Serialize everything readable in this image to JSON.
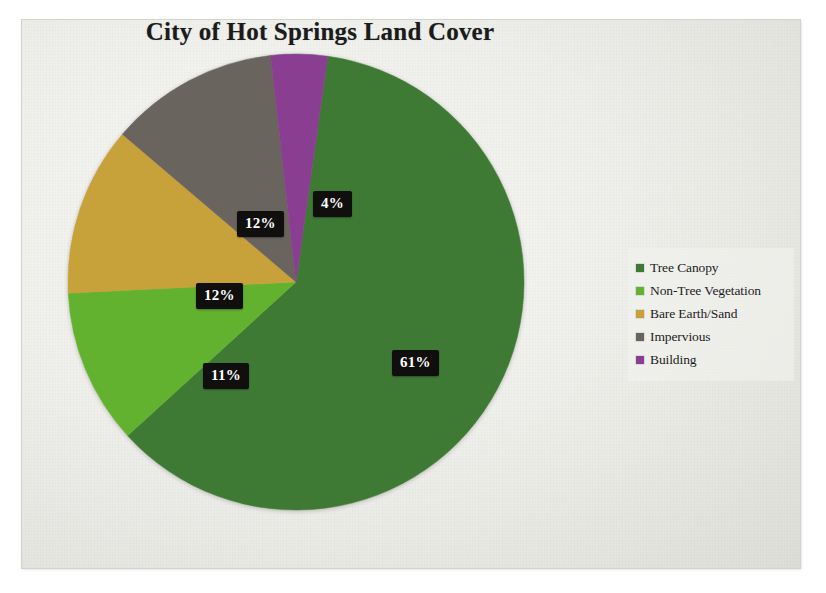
{
  "chart_data": {
    "type": "pie",
    "title": "City of Hot Springs Land Cover",
    "xlabel": "",
    "ylabel": "",
    "legend_position": "right",
    "grid": false,
    "categories": [
      "Tree Canopy",
      "Non-Tree Vegetation",
      "Bare Earth/Sand",
      "Impervious",
      "Building"
    ],
    "values": [
      61,
      11,
      12,
      12,
      4
    ],
    "value_unit": "%",
    "data_labels": [
      "61%",
      "11%",
      "12%",
      "12%",
      "4%"
    ],
    "colors": [
      "#3f7a35",
      "#63b22f",
      "#c7a23a",
      "#6a645f",
      "#8a3e91"
    ],
    "slices": [
      {
        "label": "Tree Canopy",
        "value": 61,
        "data_label": "61%",
        "color": "#3f7a35"
      },
      {
        "label": "Non-Tree Vegetation",
        "value": 11,
        "data_label": "11%",
        "color": "#63b22f"
      },
      {
        "label": "Bare Earth/Sand",
        "value": 12,
        "data_label": "12%",
        "color": "#c7a23a"
      },
      {
        "label": "Impervious",
        "value": 12,
        "data_label": "12%",
        "color": "#6a645f"
      },
      {
        "label": "Building",
        "value": 4,
        "data_label": "4%",
        "color": "#8a3e91"
      }
    ]
  },
  "legend": {
    "items": [
      {
        "label": "Tree Canopy",
        "color": "#3f7a35"
      },
      {
        "label": "Non-Tree Vegetation",
        "color": "#63b22f"
      },
      {
        "label": "Bare Earth/Sand",
        "color": "#c7a23a"
      },
      {
        "label": "Impervious",
        "color": "#6a645f"
      },
      {
        "label": "Building",
        "color": "#8a3e91"
      }
    ]
  },
  "theme": {
    "slide_background": "#efefea",
    "label_background": "#100f0e",
    "label_text": "#ffffff",
    "title_color": "#1b1b1b"
  }
}
